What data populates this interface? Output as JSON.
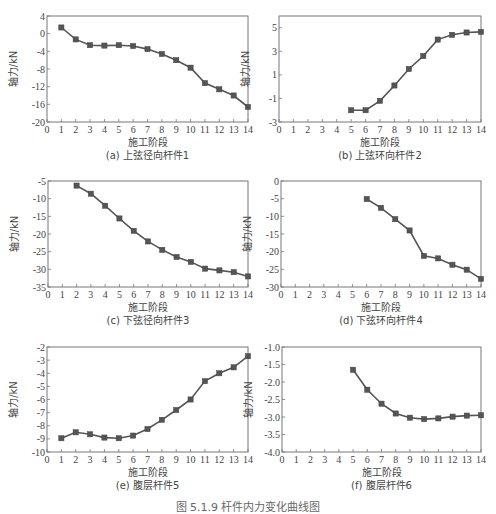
{
  "figure_caption": "图 5.1.9  杆件内力变化曲线图",
  "chart_data": [
    {
      "id": "a",
      "type": "line",
      "title": "(a) 上弦径向杆件1",
      "xlabel": "施工阶段",
      "ylabel": "轴力/kN",
      "xlim": [
        0,
        14
      ],
      "ylim": [
        -20,
        4
      ],
      "xticks": [
        0,
        1,
        2,
        3,
        4,
        5,
        6,
        7,
        8,
        9,
        10,
        11,
        12,
        13,
        14
      ],
      "yticks": [
        4,
        0,
        -4,
        -8,
        -12,
        -16,
        -20
      ],
      "x": [
        1,
        2,
        3,
        4,
        5,
        6,
        7,
        8,
        9,
        10,
        11,
        12,
        13,
        14
      ],
      "values": [
        1.4,
        -1.3,
        -2.6,
        -2.7,
        -2.6,
        -2.8,
        -3.5,
        -4.6,
        -6.0,
        -7.7,
        -11.2,
        -12.6,
        -14.0,
        -16.6
      ],
      "box": {
        "left": 47,
        "top": 16,
        "right": 248,
        "bottom": 122
      }
    },
    {
      "id": "b",
      "type": "line",
      "title": "(b) 上弦环向杆件2",
      "xlabel": "施工阶段",
      "ylabel": "轴力/kN",
      "xlim": [
        0,
        14
      ],
      "ylim": [
        -3,
        6
      ],
      "xticks": [
        0,
        1,
        2,
        3,
        4,
        5,
        6,
        7,
        8,
        9,
        10,
        11,
        12,
        13,
        14
      ],
      "yticks": [
        5,
        3,
        1,
        -1,
        -3
      ],
      "x": [
        5,
        6,
        7,
        8,
        9,
        10,
        11,
        12,
        13,
        14
      ],
      "values": [
        -2.0,
        -2.0,
        -1.2,
        0.1,
        1.5,
        2.6,
        4.0,
        4.4,
        4.6,
        4.65
      ],
      "box": {
        "left": 279,
        "top": 16,
        "right": 481,
        "bottom": 122
      }
    },
    {
      "id": "c",
      "type": "line",
      "title": "(c) 下弦径向杆件3",
      "xlabel": "施工阶段",
      "ylabel": "轴力/kN",
      "xlim": [
        0,
        14
      ],
      "ylim": [
        -35,
        -5
      ],
      "xticks": [
        0,
        1,
        2,
        3,
        4,
        5,
        6,
        7,
        8,
        9,
        10,
        11,
        12,
        13,
        14
      ],
      "yticks": [
        -5,
        -10,
        -15,
        -20,
        -25,
        -30,
        -35
      ],
      "x": [
        2,
        3,
        4,
        5,
        6,
        7,
        8,
        9,
        10,
        11,
        12,
        13,
        14
      ],
      "values": [
        -6.3,
        -8.6,
        -12.0,
        -15.6,
        -19.1,
        -22.1,
        -24.5,
        -26.5,
        -27.9,
        -29.8,
        -30.3,
        -30.8,
        -32.0
      ],
      "box": {
        "left": 48,
        "top": 181,
        "right": 248,
        "bottom": 287
      }
    },
    {
      "id": "d",
      "type": "line",
      "title": "(d) 下弦环向杆件4",
      "xlabel": "施工阶段",
      "ylabel": "轴力/kN",
      "xlim": [
        0,
        14
      ],
      "ylim": [
        -30,
        0
      ],
      "xticks": [
        0,
        1,
        2,
        3,
        4,
        5,
        6,
        7,
        8,
        9,
        10,
        11,
        12,
        13,
        14
      ],
      "yticks": [
        0,
        -5,
        -10,
        -15,
        -20,
        -25,
        -30
      ],
      "x": [
        6,
        7,
        8,
        9,
        10,
        11,
        12,
        13,
        14
      ],
      "values": [
        -5.1,
        -7.6,
        -10.8,
        -14.0,
        -21.2,
        -21.9,
        -23.7,
        -25.1,
        -27.7
      ],
      "box": {
        "left": 281,
        "top": 181,
        "right": 481,
        "bottom": 287
      }
    },
    {
      "id": "e",
      "type": "line",
      "title": "(e) 腹层杆件5",
      "xlabel": "施工阶段",
      "ylabel": "轴力/kN",
      "xlim": [
        0,
        14
      ],
      "ylim": [
        -10,
        -2
      ],
      "xticks": [
        0,
        1,
        2,
        3,
        4,
        5,
        6,
        7,
        8,
        9,
        10,
        11,
        12,
        13,
        14
      ],
      "yticks": [
        -2,
        -3,
        -4,
        -5,
        -6,
        -7,
        -8,
        -9,
        -10
      ],
      "x": [
        1,
        2,
        3,
        4,
        5,
        6,
        7,
        8,
        9,
        10,
        11,
        12,
        13,
        14
      ],
      "values": [
        -8.95,
        -8.5,
        -8.65,
        -8.9,
        -8.95,
        -8.75,
        -8.25,
        -7.55,
        -6.8,
        -6.0,
        -4.6,
        -4.0,
        -3.55,
        -2.7
      ],
      "box": {
        "left": 47,
        "top": 347,
        "right": 248,
        "bottom": 452
      }
    },
    {
      "id": "f",
      "type": "line",
      "title": "(f) 腹层杆件6",
      "xlabel": "施工阶段",
      "ylabel": "轴力/kN",
      "xlim": [
        0,
        14
      ],
      "ylim": [
        -4.0,
        -1.0
      ],
      "xticks": [
        0,
        1,
        2,
        3,
        4,
        5,
        6,
        7,
        8,
        9,
        10,
        11,
        12,
        13,
        14
      ],
      "yticks": [
        -1.0,
        -1.5,
        -2.0,
        -2.5,
        -3.0,
        -3.5,
        -4.0
      ],
      "ytick_format": 1,
      "x": [
        5,
        6,
        7,
        8,
        9,
        10,
        11,
        12,
        13,
        14
      ],
      "values": [
        -1.65,
        -2.22,
        -2.62,
        -2.9,
        -3.02,
        -3.06,
        -3.04,
        -2.99,
        -2.96,
        -2.95
      ],
      "box": {
        "left": 282,
        "top": 347,
        "right": 481,
        "bottom": 452
      }
    }
  ]
}
